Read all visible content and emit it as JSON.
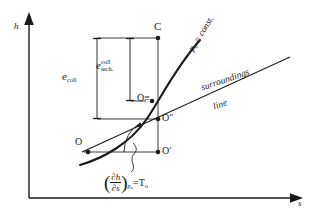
{
  "diagram": {
    "type": "thermodynamic-hs-diagram",
    "background": "#ffffff",
    "ink": "#1a1a1a"
  },
  "axes": {
    "y_label": "h",
    "x_label": "s",
    "y_name": "enthalpy-axis",
    "x_name": "entropy-axis"
  },
  "curves": {
    "isobar_label_text": "= const.",
    "isobar_label_symbol": "p",
    "isobar_label_subscript": "o",
    "surroundings_line_1": "surroundings",
    "surroundings_line_2": "line"
  },
  "points": [
    {
      "id": "C",
      "label": "C",
      "name": "point-c"
    },
    {
      "id": "O3",
      "label": "O",
      "primes": "≡",
      "name": "point-o-triple-prime"
    },
    {
      "id": "O2",
      "label": "O",
      "primes": "″",
      "name": "point-o-double-prime"
    },
    {
      "id": "O1",
      "label": "O",
      "primes": "′",
      "name": "point-o-prime"
    },
    {
      "id": "O",
      "label": "O",
      "primes": "",
      "name": "point-o"
    }
  ],
  "brackets": {
    "outer": {
      "symbol": "e",
      "sub_line1": "coll",
      "sub_line2": ""
    },
    "inner": {
      "symbol": "e",
      "sub_line1": "coll",
      "sub_line2": "tech."
    }
  },
  "formula": {
    "numerator": "∂h",
    "denominator": "∂s",
    "subscript_p": "p",
    "subscript_p_index": "o",
    "equals": "=",
    "result": "T",
    "result_index": "o"
  },
  "colors": {
    "ink": "#1a1a1a",
    "thin": "#5a5a5a"
  }
}
